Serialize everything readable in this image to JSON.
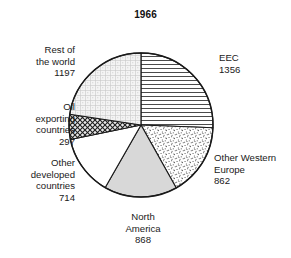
{
  "chart_data": {
    "type": "pie",
    "title": "1966",
    "subtitle": "",
    "xlabel": "",
    "ylabel": "",
    "total": 5294,
    "units": "",
    "legend_position": "outside-callout",
    "grid": false,
    "start_angle_deg": 0,
    "direction": "clockwise",
    "categories": [
      "EEC",
      "Other Western Europe",
      "North America",
      "Other developed countries",
      "Oil exporting countries",
      "Rest of the world"
    ],
    "values": [
      1356,
      862,
      868,
      714,
      297,
      1197
    ],
    "slices": [
      {
        "key": "eec",
        "label_lines": [
          "EEC"
        ],
        "value_text": "1356",
        "value": 1356,
        "percent": 25.6,
        "start_deg": 0.0,
        "end_deg": 92.2,
        "fill": "horizontal-lines",
        "fill_color": "#ffffff",
        "stroke": "#1a1a1a"
      },
      {
        "key": "other-western-europe",
        "label_lines": [
          "Other Western",
          "Europe"
        ],
        "value_text": "862",
        "value": 862,
        "percent": 16.3,
        "start_deg": 92.2,
        "end_deg": 150.8,
        "fill": "fine-stipple",
        "fill_color": "#ffffff",
        "stroke": "#1a1a1a"
      },
      {
        "key": "north-america",
        "label_lines": [
          "North",
          "America"
        ],
        "value_text": "868",
        "value": 868,
        "percent": 16.4,
        "start_deg": 150.8,
        "end_deg": 209.8,
        "fill": "solid-light-grey",
        "fill_color": "#d8d8d8",
        "stroke": "#1a1a1a"
      },
      {
        "key": "other-developed-countries",
        "label_lines": [
          "Other",
          "developed",
          "countries"
        ],
        "value_text": "714",
        "value": 714,
        "percent": 13.5,
        "start_deg": 209.8,
        "end_deg": 258.4,
        "fill": "solid-white",
        "fill_color": "#ffffff",
        "stroke": "#1a1a1a"
      },
      {
        "key": "oil-exporting-countries",
        "label_lines": [
          "Oil",
          "exporting",
          "countries"
        ],
        "value_text": "297",
        "value": 297,
        "percent": 5.6,
        "start_deg": 258.4,
        "end_deg": 278.6,
        "fill": "cross-hatch",
        "fill_color": "#9a9a9a",
        "stroke": "#1a1a1a"
      },
      {
        "key": "rest-of-the-world",
        "label_lines": [
          "Rest of",
          "the world"
        ],
        "value_text": "1197",
        "value": 1197,
        "percent": 22.6,
        "start_deg": 278.6,
        "end_deg": 360.0,
        "fill": "light-grid-dots",
        "fill_color": "#efefef",
        "stroke": "#1a1a1a"
      }
    ],
    "geometry": {
      "cx": 141,
      "cy": 125,
      "r": 72
    },
    "colors": {
      "outline": "#1a1a1a",
      "background": "#ffffff",
      "text": "#1a1a1a",
      "north_america_fill": "#d8d8d8",
      "rest_of_world_fill": "#efefef",
      "oil_fill": "#9a9a9a"
    }
  },
  "labels": {
    "eec": {
      "line1": "EEC",
      "line2": "1356"
    },
    "other_western_europe": {
      "line1": "Other Western",
      "line2": "Europe",
      "line3": "862"
    },
    "north_america": {
      "line1": "North",
      "line2": "America",
      "line3": "868"
    },
    "other_developed": {
      "line1": "Other",
      "line2": "developed",
      "line3": "countries",
      "line4": "714"
    },
    "oil_exporting": {
      "line1": "Oil",
      "line2": "exporting",
      "line3": "countries",
      "line4": "297"
    },
    "rest_of_world": {
      "line1": "Rest of",
      "line2": "the world",
      "line3": "1197"
    }
  }
}
